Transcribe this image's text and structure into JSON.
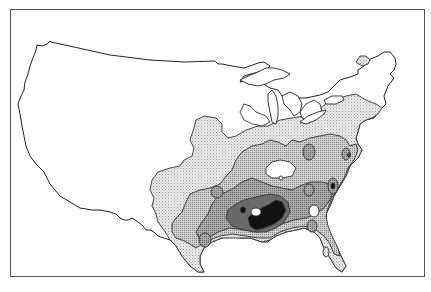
{
  "map": {
    "title": "",
    "subject": "Continental United States with shaded density contours concentrated in the Southeast",
    "levels": [
      {
        "id": "level-0",
        "label": "none",
        "color": "#ffffff"
      },
      {
        "id": "level-1",
        "label": "low",
        "color": "#d9d9d9"
      },
      {
        "id": "level-2",
        "label": "moderate",
        "color": "#b3b3b3"
      },
      {
        "id": "level-3",
        "label": "high",
        "color": "#8c8c8c"
      },
      {
        "id": "level-4",
        "label": "very high",
        "color": "#606060"
      },
      {
        "id": "level-5",
        "label": "highest",
        "color": "#111111"
      }
    ],
    "regions_highlighted": [
      "Southeast",
      "Gulf Coast",
      "Mid-Atlantic",
      "Ohio Valley",
      "Northeast"
    ],
    "peak_region": "Mississippi / Alabama"
  }
}
